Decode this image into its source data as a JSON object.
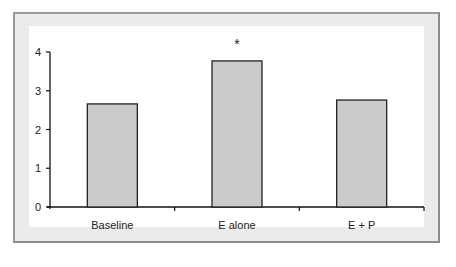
{
  "chart_data": {
    "type": "bar",
    "title": "",
    "xlabel": "",
    "ylabel": "",
    "categories": [
      "Baseline",
      "E alone",
      "E + P"
    ],
    "values": [
      2.66,
      3.77,
      2.76
    ],
    "ylim": [
      0,
      4
    ],
    "yticks": [
      "0",
      "1",
      "2",
      "3",
      "4"
    ],
    "annotations": [
      {
        "category": "E alone",
        "text": "*"
      }
    ],
    "grid": false,
    "legend": null,
    "colors": {
      "bar_fill": "#cbcbcb",
      "bar_stroke": "#222222",
      "frame": "#8c8c8c",
      "margin": "#ebebeb"
    }
  }
}
